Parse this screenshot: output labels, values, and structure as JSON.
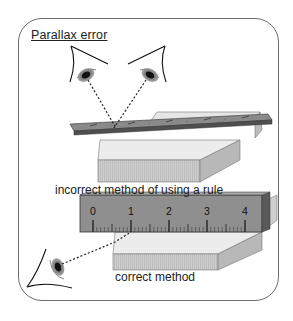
{
  "title": "Parallax error",
  "captions": {
    "incorrect": "incorrect method of using a rule",
    "correct": "correct method"
  },
  "ruler_labels": [
    "0",
    "1",
    "2",
    "3",
    "4"
  ],
  "colors": {
    "panel_border": "#6d6d6d",
    "ruler_top_face": "#8c8c8c",
    "ruler_edge": "#555555",
    "block_face": "#d4d4d4",
    "block_top": "#ececec",
    "sight_line": "#222222"
  }
}
